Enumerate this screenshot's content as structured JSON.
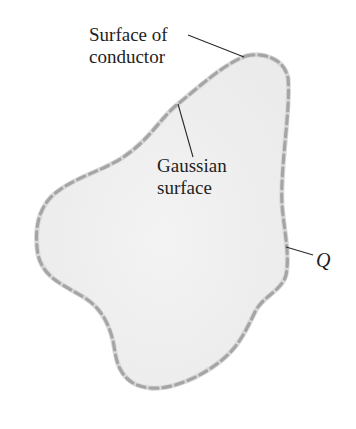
{
  "figure": {
    "type": "diagram",
    "labels": {
      "surface_of_conductor": [
        "Surface of",
        "conductor"
      ],
      "gaussian_surface": [
        "Gaussian",
        "surface"
      ],
      "charge": "Q"
    },
    "colors": {
      "background": "#ffffff",
      "conductor_fill": "#efefef",
      "surface_outline": "#d6d6d6",
      "gaussian_dash": "#a2a2a2",
      "leader_line": "#2a2a2a",
      "text": "#1e1e1e"
    }
  }
}
